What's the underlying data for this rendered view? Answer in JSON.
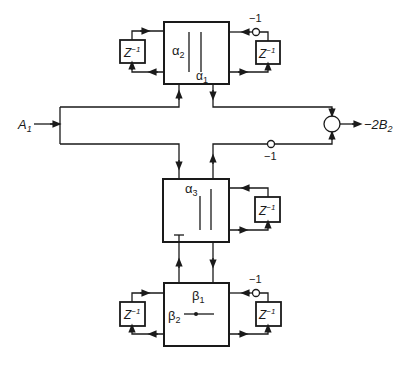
{
  "diagram": {
    "input_label": "A",
    "input_sub": "1",
    "output_label": "−2B",
    "output_sub": "2",
    "delay_label": "Z",
    "delay_exp": "−1",
    "inverter_label": "−1",
    "blocks": {
      "top": {
        "label_a": "α",
        "sub_a": "2",
        "label_b": "α",
        "sub_b": "1"
      },
      "middle": {
        "label_a": "α",
        "sub_a": "3"
      },
      "bottom": {
        "label_a": "β",
        "sub_a": "1",
        "label_b": "β",
        "sub_b": "2"
      }
    }
  }
}
